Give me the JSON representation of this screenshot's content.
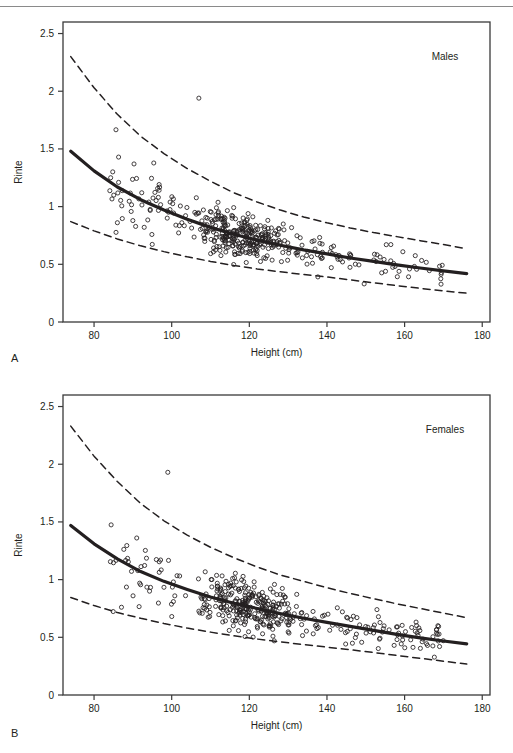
{
  "figure": {
    "panel_a_letter": "A",
    "panel_b_letter": "B",
    "top_rule": "horizontal-rule",
    "caption_fragment": ""
  },
  "chart_data": [
    {
      "type": "scatter",
      "panel": "A",
      "title": "",
      "annotation": "Males",
      "xlabel": "Height (cm)",
      "ylabel": "Rinte",
      "xlim": [
        72,
        182
      ],
      "ylim": [
        0,
        2.6
      ],
      "xticks": [
        80,
        100,
        120,
        140,
        160,
        180
      ],
      "yticks": [
        0,
        0.5,
        1,
        1.5,
        2,
        2.5
      ],
      "xtick_labels": [
        "80",
        "100",
        "120",
        "140",
        "160",
        "180"
      ],
      "ytick_labels": [
        "0",
        "0.5",
        "1",
        "1.5",
        "2",
        "2.5"
      ],
      "grid": false,
      "legend": "none",
      "marker": "open-circle",
      "n_points": 420,
      "series": [
        {
          "name": "median-fit",
          "style": "solid",
          "x": [
            74,
            80,
            86,
            92,
            98,
            104,
            110,
            116,
            122,
            128,
            134,
            140,
            146,
            152,
            158,
            164,
            170,
            176
          ],
          "values": [
            1.48,
            1.31,
            1.17,
            1.06,
            0.97,
            0.89,
            0.82,
            0.76,
            0.71,
            0.665,
            0.625,
            0.59,
            0.555,
            0.525,
            0.495,
            0.468,
            0.443,
            0.42
          ]
        },
        {
          "name": "upper-reference-limit",
          "style": "dashed",
          "x": [
            74,
            80,
            86,
            92,
            98,
            104,
            110,
            116,
            122,
            128,
            134,
            140,
            146,
            152,
            158,
            164,
            170,
            176
          ],
          "values": [
            2.3,
            2.03,
            1.8,
            1.61,
            1.46,
            1.33,
            1.22,
            1.12,
            1.04,
            0.97,
            0.91,
            0.86,
            0.815,
            0.775,
            0.74,
            0.705,
            0.672,
            0.635
          ]
        },
        {
          "name": "lower-reference-limit",
          "style": "dashed",
          "x": [
            74,
            80,
            86,
            92,
            98,
            104,
            110,
            116,
            122,
            128,
            134,
            140,
            146,
            152,
            158,
            164,
            170,
            176
          ],
          "values": [
            0.87,
            0.79,
            0.72,
            0.66,
            0.61,
            0.565,
            0.525,
            0.49,
            0.46,
            0.435,
            0.412,
            0.39,
            0.365,
            0.34,
            0.315,
            0.292,
            0.27,
            0.25
          ]
        }
      ],
      "scatter_summary": {
        "x_range": [
          74,
          176
        ],
        "y_range": [
          0.21,
          1.95
        ],
        "dense_cluster_x": [
          104,
          132
        ],
        "dense_cluster_y": [
          0.45,
          0.95
        ],
        "outlier_high": {
          "x": 107,
          "y": 1.94
        }
      }
    },
    {
      "type": "scatter",
      "panel": "B",
      "title": "",
      "annotation": "Females",
      "xlabel": "Height (cm)",
      "ylabel": "Rinte",
      "xlim": [
        72,
        182
      ],
      "ylim": [
        0,
        2.6
      ],
      "xticks": [
        80,
        100,
        120,
        140,
        160,
        180
      ],
      "yticks": [
        0,
        0.5,
        1,
        1.5,
        2,
        2.5
      ],
      "xtick_labels": [
        "80",
        "100",
        "120",
        "140",
        "160",
        "180"
      ],
      "ytick_labels": [
        "0",
        "0.5",
        "1",
        "1.5",
        "2",
        "2.5"
      ],
      "grid": false,
      "legend": "none",
      "marker": "open-circle",
      "n_points": 430,
      "series": [
        {
          "name": "median-fit",
          "style": "solid",
          "x": [
            74,
            80,
            86,
            92,
            98,
            104,
            110,
            116,
            122,
            128,
            134,
            140,
            146,
            152,
            158,
            164,
            170,
            176
          ],
          "values": [
            1.47,
            1.31,
            1.18,
            1.07,
            0.985,
            0.915,
            0.85,
            0.795,
            0.75,
            0.705,
            0.665,
            0.63,
            0.595,
            0.56,
            0.525,
            0.495,
            0.468,
            0.443
          ]
        },
        {
          "name": "upper-reference-limit",
          "style": "dashed",
          "x": [
            74,
            80,
            86,
            92,
            98,
            104,
            110,
            116,
            122,
            128,
            134,
            140,
            146,
            152,
            158,
            164,
            170,
            176
          ],
          "values": [
            2.33,
            2.07,
            1.85,
            1.66,
            1.51,
            1.385,
            1.28,
            1.19,
            1.11,
            1.04,
            0.985,
            0.93,
            0.88,
            0.835,
            0.79,
            0.75,
            0.71,
            0.67
          ]
        },
        {
          "name": "lower-reference-limit",
          "style": "dashed",
          "x": [
            74,
            80,
            86,
            92,
            98,
            104,
            110,
            116,
            122,
            128,
            134,
            140,
            146,
            152,
            158,
            164,
            170,
            176
          ],
          "values": [
            0.845,
            0.775,
            0.715,
            0.665,
            0.62,
            0.58,
            0.545,
            0.513,
            0.485,
            0.46,
            0.437,
            0.415,
            0.392,
            0.368,
            0.343,
            0.318,
            0.293,
            0.268
          ]
        }
      ],
      "scatter_summary": {
        "x_range": [
          74,
          170
        ],
        "y_range": [
          0.26,
          1.93
        ],
        "dense_cluster_x": [
          104,
          136
        ],
        "dense_cluster_y": [
          0.45,
          1.0
        ],
        "outlier_high": {
          "x": 99,
          "y": 1.93
        }
      }
    }
  ],
  "colors": {
    "ink": "#231f20",
    "axis": "#3a3a3a",
    "rule": "#8a8a8a",
    "background": "#ffffff"
  }
}
